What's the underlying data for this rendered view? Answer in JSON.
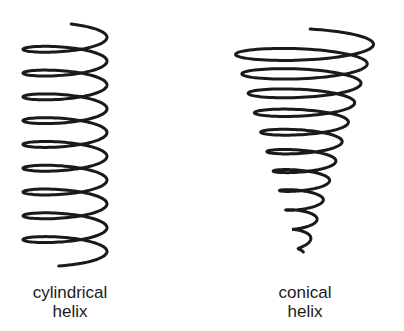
{
  "figure": {
    "stroke_color": "#1a1a1a",
    "background": "#ffffff",
    "cylindrical": {
      "label_line1": "cylindrical",
      "label_line2": "helix",
      "turns": 10
    },
    "conical": {
      "label_line1": "conical",
      "label_line2": "helix",
      "turns": 11
    }
  }
}
